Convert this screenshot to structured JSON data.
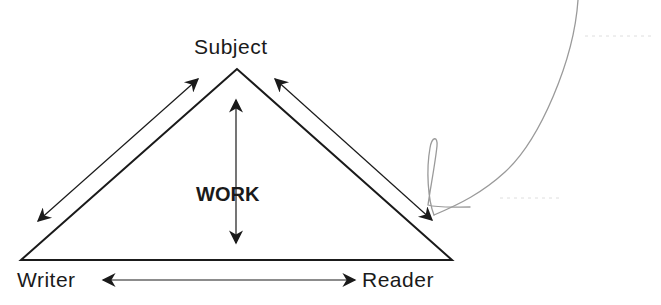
{
  "diagram": {
    "nodes": {
      "subject": "Subject",
      "writer": "Writer",
      "reader": "Reader"
    },
    "center_label": "WORK",
    "edges": [
      {
        "from": "writer",
        "to": "subject",
        "direction": "bidirectional"
      },
      {
        "from": "subject",
        "to": "reader",
        "direction": "bidirectional"
      },
      {
        "from": "writer",
        "to": "reader",
        "direction": "bidirectional"
      },
      {
        "from": "subject",
        "to": "work",
        "direction": "bidirectional"
      }
    ],
    "annotation": {
      "type": "hand-drawn pencil arrow",
      "points_to": "subject-reader arrow"
    },
    "colors": {
      "ink": "#1a1a1a",
      "pencil": "#9a9a9a",
      "background": "#ffffff"
    }
  }
}
